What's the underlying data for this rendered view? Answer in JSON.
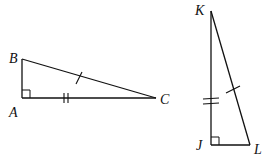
{
  "diagram": {
    "type": "geometry",
    "colors": {
      "stroke": "#111111",
      "background": "#ffffff"
    },
    "triangles": [
      {
        "name": "triangle-abc",
        "vertices": {
          "A": {
            "label": "A",
            "x": 22,
            "y": 98
          },
          "B": {
            "label": "B",
            "x": 22,
            "y": 59
          },
          "C": {
            "label": "C",
            "x": 156,
            "y": 98
          }
        },
        "right_angle_at": "A",
        "marks": [
          {
            "segment": "BC",
            "ticks": 1
          },
          {
            "segment": "AC",
            "ticks": 2
          }
        ]
      },
      {
        "name": "triangle-jkl",
        "vertices": {
          "J": {
            "label": "J",
            "x": 211,
            "y": 145
          },
          "K": {
            "label": "K",
            "x": 211,
            "y": 11
          },
          "L": {
            "label": "L",
            "x": 250,
            "y": 145
          }
        },
        "right_angle_at": "J",
        "marks": [
          {
            "segment": "KL",
            "ticks": 1
          },
          {
            "segment": "KJ",
            "ticks": 2
          }
        ]
      }
    ],
    "labels": {
      "A": "A",
      "B": "B",
      "C": "C",
      "J": "J",
      "K": "K",
      "L": "L"
    }
  }
}
